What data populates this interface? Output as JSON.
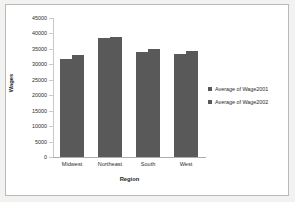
{
  "chart_data": {
    "type": "bar",
    "title": "",
    "xlabel": "Region",
    "ylabel": "Wages",
    "categories": [
      "Midwest",
      "Northeast",
      "South",
      "West"
    ],
    "series": [
      {
        "name": "Average of Wage2001",
        "values": [
          31700,
          38500,
          33900,
          33300
        ]
      },
      {
        "name": "Average of Wage2002",
        "values": [
          32900,
          38900,
          35000,
          34200
        ]
      }
    ],
    "ylim": [
      0,
      45000
    ],
    "ytick_labels": [
      "45000",
      "40000",
      "35000",
      "30000",
      "25000",
      "20000",
      "15000",
      "10000",
      "5000",
      "0"
    ],
    "ytick_values": [
      45000,
      40000,
      35000,
      30000,
      25000,
      20000,
      15000,
      10000,
      5000,
      0
    ],
    "grid": false,
    "legend_position": "right",
    "bar_color": "#595959"
  },
  "legend": {
    "items": [
      {
        "label": "Average of Wage2001"
      },
      {
        "label": "Average of Wage2002"
      }
    ]
  }
}
